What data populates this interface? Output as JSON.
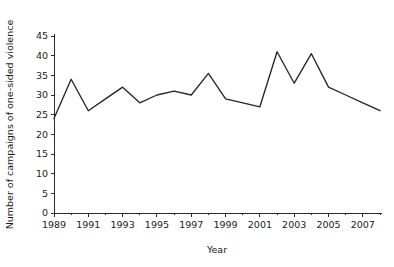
{
  "chart_data": {
    "type": "line",
    "title": "",
    "subtitle": "",
    "xlabel": "Year",
    "ylabel": "Number of campaigns of one-sided violence",
    "xlim": [
      1989,
      2008
    ],
    "ylim": [
      0,
      45
    ],
    "grid": false,
    "legend": false,
    "legend_position": "none",
    "line_color": "#262626",
    "x": [
      1989,
      1990,
      1991,
      1992,
      1993,
      1994,
      1995,
      1996,
      1997,
      1998,
      1999,
      2000,
      2001,
      2002,
      2003,
      2004,
      2005,
      2006,
      2007,
      2008
    ],
    "values": [
      24,
      34,
      26,
      29,
      32,
      28,
      30,
      31,
      30,
      35.5,
      29,
      28,
      27,
      41,
      33,
      40.5,
      32,
      30,
      28,
      26
    ],
    "series": [
      {
        "name": "Number of campaigns of one-sided violence",
        "values": [
          24,
          34,
          26,
          29,
          32,
          28,
          30,
          31,
          30,
          35.5,
          29,
          28,
          27,
          41,
          33,
          40.5,
          32,
          30,
          28,
          26
        ]
      }
    ],
    "x_tick_labels": [
      "1989",
      "1991",
      "1993",
      "1995",
      "1997",
      "1999",
      "2001",
      "2003",
      "2005",
      "2007"
    ],
    "x_tick_values": [
      1989,
      1991,
      1993,
      1995,
      1997,
      1999,
      2001,
      2003,
      2005,
      2007
    ],
    "x_minor_tick_values": [
      1990,
      1992,
      1994,
      1996,
      1998,
      2000,
      2002,
      2004,
      2006,
      2008
    ],
    "y_tick_labels": [
      "0",
      "5",
      "10",
      "15",
      "20",
      "25",
      "30",
      "35",
      "40",
      "45"
    ],
    "y_tick_values": [
      0,
      5,
      10,
      15,
      20,
      25,
      30,
      35,
      40,
      45
    ]
  }
}
